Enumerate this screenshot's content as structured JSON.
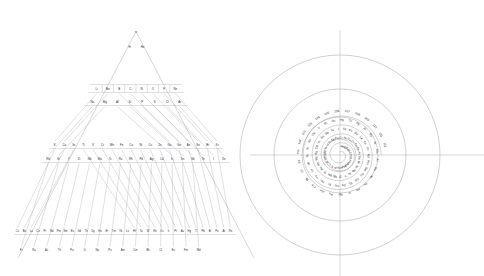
{
  "figure": {
    "panels": [
      "triangular-periodic-table",
      "spiral-periodic-table"
    ],
    "line_color": "#8e8e96",
    "text_color": "#2b2b2b",
    "background": "#ffffff"
  },
  "chart_data": {
    "type": "diagram",
    "title": "",
    "xlabel": "",
    "ylabel": "",
    "panels": [
      {
        "name": "triangular-periodic-table",
        "shape": "triangle",
        "rows": [
          {
            "period": 0,
            "elements": [
              "n"
            ]
          },
          {
            "period": 1,
            "elements": [
              "H",
              "He"
            ]
          },
          {
            "period": 2,
            "elements": [
              "Li",
              "Be",
              "B",
              "C",
              "N",
              "O",
              "F",
              "Ne"
            ]
          },
          {
            "period": 3,
            "elements": [
              "Na",
              "Mg",
              "Al",
              "Si",
              "P",
              "S",
              "Cl",
              "Ar"
            ]
          },
          {
            "period": 4,
            "elements": [
              "K",
              "Ca",
              "Sc",
              "Ti",
              "V",
              "Cr",
              "Mn",
              "Fe",
              "Co",
              "Ni",
              "Cu",
              "Zn",
              "Ga",
              "Ge",
              "As",
              "Se",
              "Br",
              "Kr"
            ]
          },
          {
            "period": 5,
            "elements": [
              "Rb",
              "Sr",
              "Y",
              "Zr",
              "Nb",
              "Mo",
              "Tc",
              "Ru",
              "Rh",
              "Pd",
              "Ag",
              "Cd",
              "In",
              "Sn",
              "Sb",
              "Te",
              "I",
              "Xe"
            ]
          },
          {
            "period": 6,
            "elements": [
              "Cs",
              "Ba",
              "La",
              "Ce",
              "Pr",
              "Nd",
              "Pm",
              "Sm",
              "Eu",
              "Gd",
              "Tb",
              "Dy",
              "Ho",
              "Er",
              "Tm",
              "Yb",
              "Lu",
              "Hf",
              "Ta",
              "W",
              "Re",
              "Os",
              "Ir",
              "Pt",
              "Au",
              "Hg",
              "Tl",
              "Pb",
              "Bi",
              "Po",
              "At",
              "Rn"
            ]
          },
          {
            "period": 7,
            "elements": [
              "Fr",
              "Ra",
              "Ac",
              "Th",
              "Pa",
              "U",
              "Np",
              "Pu",
              "Am",
              "Cm",
              "Bk",
              "Cf",
              "Es",
              "Fm",
              "Md"
            ]
          }
        ]
      },
      {
        "name": "spiral-periodic-table",
        "shape": "spiral",
        "turns": 4,
        "sequence": [
          "H",
          "He",
          "Li",
          "Be",
          "B",
          "C",
          "N",
          "O",
          "F",
          "Ne",
          "Na",
          "Mg",
          "Al",
          "Si",
          "P",
          "S",
          "Cl",
          "Ar",
          "K",
          "Ca",
          "Sc",
          "Ti",
          "V",
          "Cr",
          "Mn",
          "Fe",
          "Co",
          "Ni",
          "Cu",
          "Zn",
          "Ga",
          "Ge",
          "As",
          "Se",
          "Br",
          "Kr",
          "Rb",
          "Sr",
          "Y",
          "Zr",
          "Nb",
          "Mo",
          "Tc",
          "Ru",
          "Rh",
          "Pd",
          "Ag",
          "Cd",
          "In",
          "Sn",
          "Sb",
          "Te",
          "I",
          "Xe",
          "Cs",
          "Ba",
          "La",
          "Ce",
          "Pr",
          "Nd",
          "Pm",
          "Sm",
          "Eu",
          "Gd",
          "Tb",
          "Dy",
          "Ho",
          "Er",
          "Tm",
          "Yb",
          "Lu",
          "Hf",
          "Ta",
          "W",
          "Re",
          "Os",
          "Ir",
          "Pt",
          "Au",
          "Hg",
          "Tl",
          "Pb",
          "Bi",
          "Po",
          "At",
          "Rn",
          "Fr",
          "Ra",
          "Ac",
          "Th",
          "Pa",
          "U",
          "Np",
          "Pu",
          "Am",
          "Cm",
          "Bk",
          "Cf",
          "Es",
          "Fm",
          "Md",
          "102",
          "103",
          "104",
          "105",
          "106",
          "107",
          "108",
          "109",
          "110",
          "111",
          "112"
        ],
        "numeric_labels": [
          "102",
          "103",
          "104",
          "105",
          "106",
          "107",
          "108",
          "109",
          "110",
          "111",
          "112"
        ]
      }
    ]
  }
}
